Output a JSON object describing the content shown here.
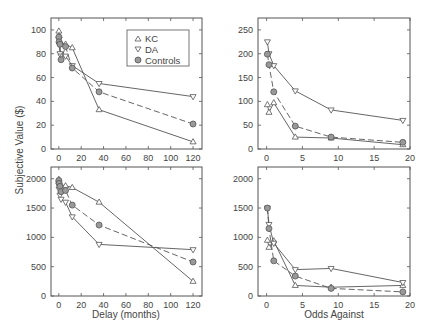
{
  "figure": {
    "ylabel": "Subjective Value ($)",
    "legend": [
      {
        "label": "KC",
        "marker": "triangle-up"
      },
      {
        "label": "DA",
        "marker": "triangle-down"
      },
      {
        "label": "Controls",
        "marker": "circle-filled"
      }
    ]
  },
  "chart_data": [
    {
      "type": "line",
      "panel": "top-left",
      "title": "",
      "xlabel": "",
      "ylabel": "Subjective Value ($)",
      "xlim": [
        -7,
        128
      ],
      "ylim": [
        0,
        110
      ],
      "xticks": [
        0,
        20,
        40,
        60,
        80,
        100,
        120
      ],
      "yticks": [
        0,
        20,
        40,
        60,
        80,
        100
      ],
      "grid": false,
      "legend_position": "upper right",
      "series": [
        {
          "name": "KC",
          "marker": "triangle-up",
          "dash": false,
          "x": [
            0.03,
            0.25,
            1,
            6,
            12,
            36,
            120
          ],
          "y": [
            99,
            95,
            90,
            88,
            85,
            33,
            6
          ]
        },
        {
          "name": "DA",
          "marker": "triangle-down",
          "dash": false,
          "x": [
            0.03,
            0.25,
            1,
            2,
            6,
            12,
            36,
            120
          ],
          "y": [
            92,
            88,
            80,
            78,
            78,
            70,
            55,
            44
          ]
        },
        {
          "name": "Controls",
          "marker": "circle-filled",
          "dash": true,
          "x": [
            0.03,
            0.25,
            1,
            2,
            6,
            12,
            36,
            120
          ],
          "y": [
            94,
            90,
            88,
            75,
            86,
            68,
            48,
            21
          ]
        }
      ]
    },
    {
      "type": "line",
      "panel": "top-right",
      "title": "",
      "xlabel": "",
      "ylabel": "",
      "xlim": [
        -1.2,
        20
      ],
      "ylim": [
        0,
        275
      ],
      "xticks": [
        0,
        5,
        10,
        15,
        20
      ],
      "yticks": [
        0,
        50,
        100,
        150,
        200,
        250
      ],
      "grid": false,
      "series": [
        {
          "name": "KC",
          "marker": "triangle-up",
          "dash": false,
          "x": [
            0.11,
            0.33,
            1,
            4,
            9,
            19
          ],
          "y": [
            93,
            77,
            97,
            25,
            23,
            9
          ]
        },
        {
          "name": "DA",
          "marker": "triangle-down",
          "dash": false,
          "x": [
            0.11,
            0.33,
            1,
            4,
            9,
            19
          ],
          "y": [
            225,
            200,
            175,
            122,
            82,
            60
          ]
        },
        {
          "name": "Controls",
          "marker": "circle-filled",
          "dash": true,
          "x": [
            0.11,
            0.33,
            1,
            4,
            9,
            19
          ],
          "y": [
            199,
            177,
            120,
            48,
            25,
            14
          ]
        }
      ]
    },
    {
      "type": "line",
      "panel": "bottom-left",
      "title": "",
      "xlabel": "Delay (months)",
      "ylabel": "Subjective Value ($)",
      "xlim": [
        -7,
        128
      ],
      "ylim": [
        0,
        2200
      ],
      "xticks": [
        0,
        20,
        40,
        60,
        80,
        100,
        120
      ],
      "yticks": [
        0,
        500,
        1000,
        1500,
        2000
      ],
      "grid": false,
      "series": [
        {
          "name": "KC",
          "marker": "triangle-up",
          "dash": false,
          "x": [
            0.03,
            0.25,
            1,
            6,
            12,
            36,
            120
          ],
          "y": [
            1990,
            1950,
            1900,
            1880,
            1850,
            1600,
            250
          ]
        },
        {
          "name": "DA",
          "marker": "triangle-down",
          "dash": false,
          "x": [
            0.03,
            0.25,
            1,
            2,
            6,
            12,
            36,
            120
          ],
          "y": [
            1900,
            1820,
            1720,
            1650,
            1600,
            1350,
            880,
            790
          ]
        },
        {
          "name": "Controls",
          "marker": "circle-filled",
          "dash": true,
          "x": [
            0.03,
            0.25,
            1,
            2,
            6,
            12,
            36,
            120
          ],
          "y": [
            1970,
            1920,
            1870,
            1780,
            1800,
            1550,
            1210,
            580
          ]
        }
      ]
    },
    {
      "type": "line",
      "panel": "bottom-right",
      "title": "",
      "xlabel": "Odds Against",
      "ylabel": "",
      "xlim": [
        -1.2,
        20
      ],
      "ylim": [
        0,
        2200
      ],
      "xticks": [
        0,
        5,
        10,
        15,
        20
      ],
      "yticks": [
        0,
        500,
        1000,
        1500,
        2000
      ],
      "grid": false,
      "series": [
        {
          "name": "KC",
          "marker": "triangle-up",
          "dash": false,
          "x": [
            0.11,
            0.33,
            1,
            4,
            9,
            19
          ],
          "y": [
            950,
            830,
            940,
            180,
            150,
            180
          ]
        },
        {
          "name": "DA",
          "marker": "triangle-down",
          "dash": false,
          "x": [
            0.11,
            0.33,
            1,
            4,
            9,
            19
          ],
          "y": [
            1500,
            1220,
            900,
            450,
            470,
            230
          ]
        },
        {
          "name": "Controls",
          "marker": "circle-filled",
          "dash": true,
          "x": [
            0.11,
            0.33,
            1,
            4,
            9,
            19
          ],
          "y": [
            1500,
            1150,
            600,
            340,
            130,
            70
          ]
        }
      ]
    }
  ]
}
